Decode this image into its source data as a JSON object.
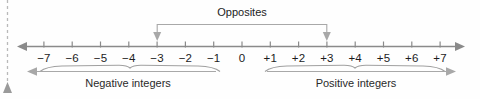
{
  "figure": {
    "type": "number-line-diagram",
    "background_color": "#fefefe",
    "axis_color": "#8a8a8a",
    "text_color": "#1c1c1c",
    "bracket_color": "#a8a8a8"
  },
  "number_line": {
    "ticks": [
      {
        "value": -7,
        "label": "−7"
      },
      {
        "value": -6,
        "label": "−6"
      },
      {
        "value": -5,
        "label": "−5"
      },
      {
        "value": -4,
        "label": "−4"
      },
      {
        "value": -3,
        "label": "−3"
      },
      {
        "value": -2,
        "label": "−2"
      },
      {
        "value": -1,
        "label": "−1"
      },
      {
        "value": 0,
        "label": "0"
      },
      {
        "value": 1,
        "label": "+1"
      },
      {
        "value": 2,
        "label": "+2"
      },
      {
        "value": 3,
        "label": "+3"
      },
      {
        "value": 4,
        "label": "+4"
      },
      {
        "value": 5,
        "label": "+5"
      },
      {
        "value": 6,
        "label": "+6"
      },
      {
        "value": 7,
        "label": "+7"
      }
    ],
    "min": -7,
    "max": 7,
    "left_arrow": true,
    "right_arrow": true
  },
  "annotations": {
    "opposites": {
      "label": "Opposites",
      "from_value": -3,
      "to_value": 3
    },
    "negative_group": {
      "label": "Negative integers",
      "from_value": -7,
      "to_value": -1,
      "arrow_direction": "left"
    },
    "positive_group": {
      "label": "Positive integers",
      "from_value": 1,
      "to_value": 7,
      "arrow_direction": "right"
    }
  },
  "page_edge": {
    "name": "dashed-margin-line",
    "marker": "triangle-up"
  }
}
